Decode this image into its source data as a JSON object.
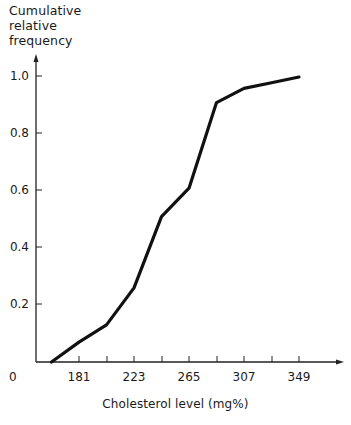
{
  "chart_data": {
    "type": "line",
    "title": "",
    "ylabel": "Cumulative relative frequency",
    "xlabel": "Cholesterol level (mg%)",
    "x": [
      160,
      181,
      202,
      223,
      244,
      265,
      286,
      307,
      328,
      349
    ],
    "series": [
      {
        "name": "Cumulative relative frequency",
        "values": [
          0.0,
          0.07,
          0.13,
          0.26,
          0.51,
          0.61,
          0.91,
          0.96,
          0.98,
          1.0
        ]
      }
    ],
    "x_tick_labels": [
      "181",
      "223",
      "265",
      "307",
      "349"
    ],
    "x_tick_values": [
      181,
      202,
      223,
      244,
      265,
      286,
      307,
      328,
      349
    ],
    "y_tick_labels": [
      "0.2",
      "0.4",
      "0.6",
      "0.8",
      "1.0"
    ],
    "y_tick_values": [
      0.2,
      0.4,
      0.6,
      0.8,
      1.0
    ],
    "origin_label": "0",
    "xlim": [
      139,
      370
    ],
    "ylim": [
      0,
      1.05
    ],
    "grid": false,
    "legend": "none",
    "line_color": "#111111"
  },
  "labels": {
    "y_axis_title": "Cumulative\nrelative\nfrequency",
    "x_axis_title": "Cholesterol level (mg%)",
    "origin": "0",
    "y_ticks": [
      "1.0",
      "0.8",
      "0.6",
      "0.4",
      "0.2"
    ],
    "x_ticks": [
      "181",
      "223",
      "265",
      "307",
      "349"
    ]
  }
}
